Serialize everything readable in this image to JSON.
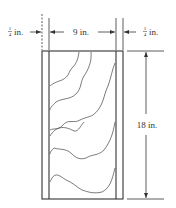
{
  "diagram": {
    "labels": {
      "left_strip": {
        "num": "1",
        "den": "4",
        "unit": "in."
      },
      "width": "9 in.",
      "right_strip": {
        "num": "1",
        "den": "4",
        "unit": "in."
      },
      "height": "18 in."
    },
    "dimensions": {
      "strip_width_in": 0.25,
      "board_width_in": 9,
      "board_height_in": 18
    },
    "colors": {
      "line": "#333333",
      "background": "#ffffff"
    }
  }
}
